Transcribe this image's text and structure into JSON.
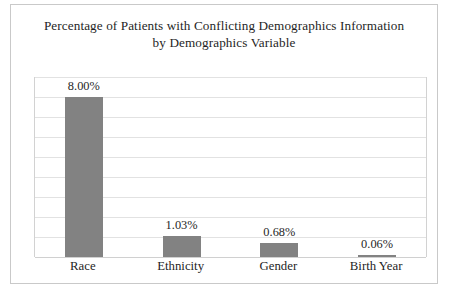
{
  "chart_data": {
    "type": "bar",
    "title": "Percentage of Patients with Conflicting Demographics Information by Demographics Variable",
    "title_lines": [
      "Percentage of Patients with Conflicting Demographics Information",
      "by Demographics Variable"
    ],
    "categories": [
      "Race",
      "Ethnicity",
      "Gender",
      "Birth Year"
    ],
    "values": [
      8.0,
      1.03,
      0.68,
      0.06
    ],
    "value_labels": [
      "8.00%",
      "1.03%",
      "0.68%",
      "0.06%"
    ],
    "xlabel": "",
    "ylabel": "",
    "ylim": [
      0,
      9
    ],
    "y_gridline_values": [
      9,
      8,
      7,
      6,
      5,
      4,
      3,
      2,
      1,
      0
    ],
    "y_tick_labels_shown": false,
    "grid": true,
    "legend": "none",
    "series_color": "#828282",
    "gridline_color": "#e2e2e2",
    "frame_color": "#c9c9c9",
    "text_color": "#1f1f1f",
    "background": "#ffffff"
  }
}
